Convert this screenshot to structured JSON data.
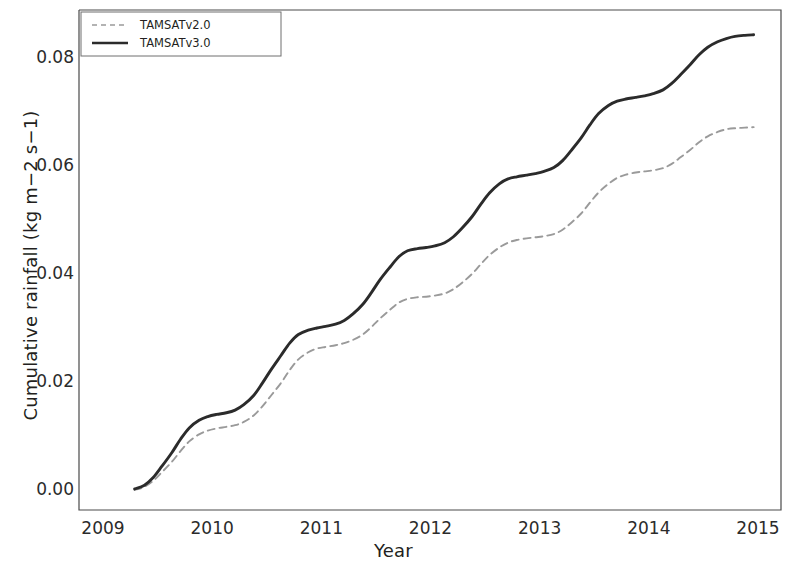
{
  "chart_data": {
    "type": "line",
    "title": "",
    "xlabel": "Year",
    "ylabel": "Cumulative rainfall (kg m−2 s−1)",
    "xlim": [
      2009.0,
      2015.05
    ],
    "ylim": [
      0.0,
      0.0875
    ],
    "xticks": [
      "2009",
      "2010",
      "2011",
      "2012",
      "2013",
      "2014",
      "2015"
    ],
    "xtick_values": [
      2009,
      2010,
      2011,
      2012,
      2013,
      2014,
      2015
    ],
    "yticks": [
      "0.00",
      "0.02",
      "0.04",
      "0.06",
      "0.08"
    ],
    "ytick_values": [
      0.0,
      0.02,
      0.04,
      0.06,
      0.08
    ],
    "grid": false,
    "legend_position": "top-left",
    "frame": true,
    "series": [
      {
        "name": "TAMSATv2.0",
        "style": "dashed",
        "color": "#9a9a9a",
        "x": [
          2009.29,
          2009.38,
          2009.46,
          2009.54,
          2009.63,
          2009.71,
          2009.79,
          2009.88,
          2009.96,
          2010.04,
          2010.13,
          2010.21,
          2010.29,
          2010.38,
          2010.46,
          2010.54,
          2010.63,
          2010.71,
          2010.79,
          2010.88,
          2010.96,
          2011.04,
          2011.13,
          2011.21,
          2011.29,
          2011.38,
          2011.46,
          2011.54,
          2011.63,
          2011.71,
          2011.79,
          2011.88,
          2011.96,
          2012.04,
          2012.13,
          2012.21,
          2012.29,
          2012.38,
          2012.46,
          2012.54,
          2012.63,
          2012.71,
          2012.79,
          2012.88,
          2012.96,
          2013.04,
          2013.13,
          2013.21,
          2013.29,
          2013.38,
          2013.46,
          2013.54,
          2013.63,
          2013.71,
          2013.79,
          2013.88,
          2013.96,
          2014.04,
          2014.13,
          2014.21,
          2014.29,
          2014.38,
          2014.46,
          2014.54,
          2014.63,
          2014.71,
          2014.79,
          2014.88,
          2014.96
        ],
        "y": [
          0.0,
          0.0006,
          0.0017,
          0.0033,
          0.0052,
          0.0072,
          0.009,
          0.0103,
          0.011,
          0.0114,
          0.0117,
          0.012,
          0.0126,
          0.0138,
          0.0155,
          0.0175,
          0.0198,
          0.0222,
          0.0242,
          0.0255,
          0.0262,
          0.0265,
          0.0268,
          0.0272,
          0.0278,
          0.0288,
          0.0302,
          0.0318,
          0.0334,
          0.0347,
          0.0354,
          0.0357,
          0.0358,
          0.036,
          0.0364,
          0.0372,
          0.0384,
          0.04,
          0.0418,
          0.0435,
          0.0449,
          0.0458,
          0.0463,
          0.0466,
          0.0468,
          0.047,
          0.0474,
          0.0482,
          0.0495,
          0.0512,
          0.0532,
          0.0551,
          0.0567,
          0.0578,
          0.0584,
          0.0588,
          0.059,
          0.0592,
          0.0596,
          0.0604,
          0.0616,
          0.063,
          0.0644,
          0.0655,
          0.0663,
          0.0668,
          0.067,
          0.0671,
          0.0672
        ]
      },
      {
        "name": "TAMSATv3.0",
        "style": "solid",
        "color": "#2b2b2b",
        "x": [
          2009.29,
          2009.38,
          2009.46,
          2009.54,
          2009.63,
          2009.71,
          2009.79,
          2009.88,
          2009.96,
          2010.04,
          2010.13,
          2010.21,
          2010.29,
          2010.38,
          2010.46,
          2010.54,
          2010.63,
          2010.71,
          2010.79,
          2010.88,
          2010.96,
          2011.04,
          2011.13,
          2011.21,
          2011.29,
          2011.38,
          2011.46,
          2011.54,
          2011.63,
          2011.71,
          2011.79,
          2011.88,
          2011.96,
          2012.04,
          2012.13,
          2012.21,
          2012.29,
          2012.38,
          2012.46,
          2012.54,
          2012.63,
          2012.71,
          2012.79,
          2012.88,
          2012.96,
          2013.04,
          2013.13,
          2013.21,
          2013.29,
          2013.38,
          2013.46,
          2013.54,
          2013.63,
          2013.71,
          2013.79,
          2013.88,
          2013.96,
          2014.04,
          2014.13,
          2014.21,
          2014.29,
          2014.38,
          2014.46,
          2014.54,
          2014.63,
          2014.71,
          2014.79,
          2014.88,
          2014.96
        ],
        "y": [
          0.0002,
          0.0009,
          0.0023,
          0.0044,
          0.0069,
          0.0094,
          0.0115,
          0.0129,
          0.0136,
          0.014,
          0.0143,
          0.0148,
          0.0158,
          0.0175,
          0.0198,
          0.0223,
          0.0249,
          0.0272,
          0.0288,
          0.0296,
          0.03,
          0.0303,
          0.0307,
          0.0314,
          0.0326,
          0.0344,
          0.0366,
          0.039,
          0.0413,
          0.0432,
          0.0443,
          0.0447,
          0.0449,
          0.0452,
          0.0458,
          0.0469,
          0.0485,
          0.0506,
          0.0529,
          0.055,
          0.0567,
          0.0576,
          0.058,
          0.0583,
          0.0586,
          0.059,
          0.0597,
          0.061,
          0.0629,
          0.0652,
          0.0676,
          0.0697,
          0.0712,
          0.072,
          0.0724,
          0.0727,
          0.073,
          0.0734,
          0.0741,
          0.0753,
          0.0769,
          0.0788,
          0.0806,
          0.082,
          0.083,
          0.0836,
          0.084,
          0.0842,
          0.0843
        ]
      }
    ],
    "legend": [
      {
        "label": "TAMSATv2.0",
        "style": "dashed",
        "color": "#9a9a9a"
      },
      {
        "label": "TAMSATv3.0",
        "style": "solid",
        "color": "#2b2b2b"
      }
    ]
  }
}
